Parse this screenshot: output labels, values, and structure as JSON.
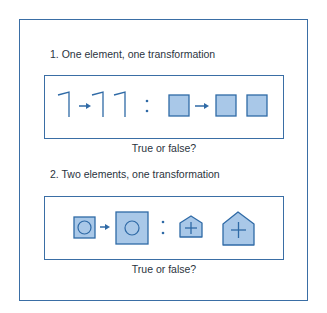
{
  "colors": {
    "stroke": "#2f6aa6",
    "fill": "#a9c8e8",
    "border": "#3a6ea5"
  },
  "questions": [
    {
      "number": "1.",
      "title": "1. One element, one transformation",
      "caption": "True or false?",
      "analogy": {
        "left_pair": [
          "single-hook-line",
          "double-hook-line"
        ],
        "separator": ":",
        "right_pair": [
          "single-filled-square",
          "two-filled-squares"
        ]
      }
    },
    {
      "number": "2.",
      "title": "2. Two elements, one transformation",
      "caption": "True or false?",
      "analogy": {
        "left_pair": [
          "small-square-with-circle",
          "large-square-with-circle"
        ],
        "separator": ":",
        "right_pair": [
          "small-house-with-plus",
          "large-house-with-plus"
        ]
      }
    }
  ]
}
